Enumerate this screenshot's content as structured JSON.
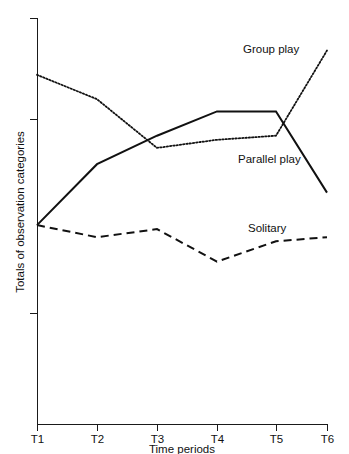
{
  "chart_data": {
    "type": "line",
    "title": "",
    "xlabel": "Time periods",
    "ylabel": "Totals of observation categories",
    "categories": [
      "T1",
      "T2",
      "T3",
      "T4",
      "T5",
      "T6"
    ],
    "grid": false,
    "legend_position": "inline-labels",
    "y_axis": {
      "tick_labels": [],
      "ticks_visible": 3,
      "range_described": "unlabelled ordinal scale of totals"
    },
    "series": [
      {
        "name": "Group play",
        "style": "dotted",
        "color": "#111111",
        "values": [
          86,
          80,
          68,
          70,
          71,
          92
        ]
      },
      {
        "name": "Parallel play",
        "style": "solid",
        "color": "#111111",
        "values": [
          49,
          64,
          71,
          77,
          77,
          57
        ]
      },
      {
        "name": "Solitary",
        "style": "dashed",
        "color": "#111111",
        "values": [
          49,
          46,
          48,
          40,
          45,
          46
        ]
      }
    ],
    "annotations": [
      {
        "text": "Group play",
        "series": "Group play"
      },
      {
        "text": "Parallel play",
        "series": "Parallel play"
      },
      {
        "text": "Solitary",
        "series": "Solitary"
      }
    ]
  },
  "axes": {
    "x_label": "Time periods",
    "y_label": "Totals of observation categories",
    "x_ticks": [
      "T1",
      "T2",
      "T3",
      "T4",
      "T5",
      "T6"
    ]
  },
  "labels": {
    "group_play": "Group play",
    "parallel_play": "Parallel play",
    "solitary": "Solitary"
  }
}
